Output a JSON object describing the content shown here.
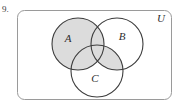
{
  "problem": {
    "number": "9."
  },
  "diagram": {
    "type": "venn-3-set",
    "universe_label": "U",
    "sets": [
      {
        "id": "A",
        "label": "A",
        "cx": 78,
        "cy": 44,
        "r": 26
      },
      {
        "id": "B",
        "label": "B",
        "cx": 117,
        "cy": 44,
        "r": 26
      },
      {
        "id": "C",
        "label": "C",
        "cx": 97,
        "cy": 71,
        "r": 26
      }
    ],
    "label_positions": [
      {
        "label": "A",
        "x": 68,
        "y": 42
      },
      {
        "label": "B",
        "x": 122,
        "y": 40
      },
      {
        "label": "C",
        "x": 95,
        "y": 82
      },
      {
        "label": "U",
        "x": 161,
        "y": 22
      }
    ],
    "shaded_expression": "A ∪ (B ∩ C)",
    "shaded_regions": [
      "A only",
      "A ∩ B only",
      "A ∩ C only",
      "A ∩ B ∩ C",
      "B ∩ C only"
    ],
    "unshaded_regions": [
      "B only",
      "C only",
      "outside all sets"
    ],
    "universe_rect": {
      "x": 17,
      "y": 10,
      "width": 155,
      "height": 90,
      "rx": 7
    }
  },
  "colors": {
    "shade_fill": "#dcdcdc",
    "circle_stroke": "#3c3c3c",
    "rect_stroke": "#9a9a9a",
    "background": "#ffffff",
    "text": "#2e2e2e"
  }
}
